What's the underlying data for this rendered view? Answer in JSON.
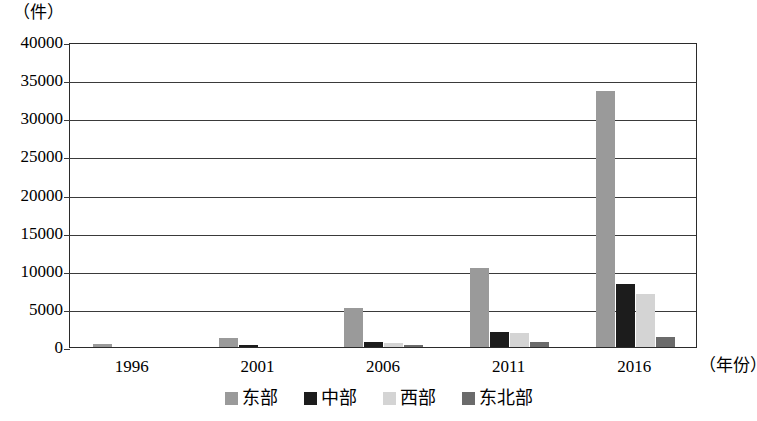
{
  "chart_data": {
    "type": "bar",
    "title": "",
    "subtitle": "",
    "xlabel": "（年份）",
    "ylabel": "（件）",
    "categories": [
      "1996",
      "2001",
      "2006",
      "2011",
      "2016"
    ],
    "series": [
      {
        "name": "东部",
        "color": "#9a9a9a",
        "values": [
          420,
          1200,
          5100,
          10300,
          33600
        ]
      },
      {
        "name": "中部",
        "color": "#1c1c1c",
        "values": [
          0,
          250,
          700,
          2000,
          8300
        ]
      },
      {
        "name": "西部",
        "color": "#d4d4d4",
        "values": [
          0,
          0,
          500,
          1900,
          7000
        ]
      },
      {
        "name": "东北部",
        "color": "#6b6b6b",
        "values": [
          0,
          0,
          300,
          700,
          1300
        ]
      }
    ],
    "ylim": [
      0,
      40000
    ],
    "ytick_values": [
      0,
      5000,
      10000,
      15000,
      20000,
      25000,
      30000,
      35000,
      40000
    ],
    "ytick_labels": [
      "0",
      "5000",
      "10000",
      "15000",
      "20000",
      "25000",
      "30000",
      "35000",
      "40000"
    ],
    "grid": true,
    "grid_axis": "y",
    "legend_position": "bottom",
    "axis_color": "#2b2b2b",
    "background": "#ffffff"
  }
}
